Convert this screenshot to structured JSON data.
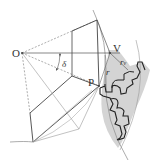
{
  "diagram": {
    "title": "",
    "labels": {
      "O": "O",
      "V": "V",
      "P": "P",
      "delta": "δ",
      "r": "r",
      "rv": "r",
      "rv_sub": "v"
    },
    "colors": {
      "line": "#555555",
      "thin_line": "#888888",
      "gear_fill": "#c8c8c8",
      "gear_outline": "#222222"
    }
  }
}
